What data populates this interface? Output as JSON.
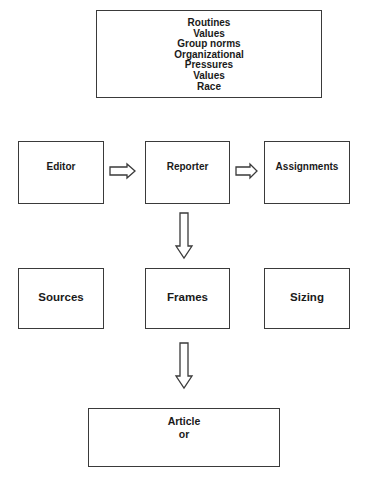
{
  "diagram": {
    "influences_box": {
      "items": [
        "Routines",
        "Values",
        "Group norms",
        "Organizational",
        "Pressures",
        "Values",
        "Race"
      ]
    },
    "row1": {
      "editor": "Editor",
      "reporter": "Reporter",
      "assignments": "Assignments"
    },
    "row2": {
      "sources": "Sources",
      "frames": "Frames",
      "sizing": "Sizing"
    },
    "output_box": {
      "line1": "Article",
      "line2": "or"
    },
    "arrows": [
      {
        "from": "Editor",
        "to": "Reporter",
        "direction": "right"
      },
      {
        "from": "Reporter",
        "to": "Assignments",
        "direction": "right"
      },
      {
        "from": "Reporter",
        "to": "Frames",
        "direction": "down"
      },
      {
        "from": "Frames",
        "to": "Article",
        "direction": "down"
      }
    ],
    "colors": {
      "stroke": "#3a3a3a",
      "text": "#1a1a1a",
      "background": "#ffffff"
    }
  }
}
